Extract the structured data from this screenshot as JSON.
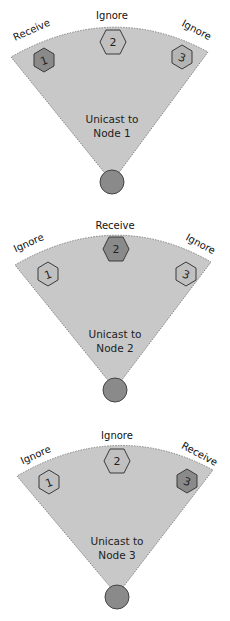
{
  "colors": {
    "wedge_fill": "#c8c8c8",
    "receiver_node": "#8a8a8a",
    "ignoring_node": "#c0c0c0",
    "source_node": "#8a8a8a"
  },
  "panels": [
    {
      "title_line1": "Unicast to",
      "title_line2": "Node 1",
      "nodes": [
        {
          "id": "1",
          "label": "Receive",
          "role": "receive"
        },
        {
          "id": "2",
          "label": "Ignore",
          "role": "ignore"
        },
        {
          "id": "3",
          "label": "Ignore",
          "role": "ignore"
        }
      ]
    },
    {
      "title_line1": "Unicast to",
      "title_line2": "Node 2",
      "nodes": [
        {
          "id": "1",
          "label": "Ignore",
          "role": "ignore"
        },
        {
          "id": "2",
          "label": "Receive",
          "role": "receive"
        },
        {
          "id": "3",
          "label": "Ignore",
          "role": "ignore"
        }
      ]
    },
    {
      "title_line1": "Unicast to",
      "title_line2": "Node 3",
      "nodes": [
        {
          "id": "1",
          "label": "Ignore",
          "role": "ignore"
        },
        {
          "id": "2",
          "label": "Ignore",
          "role": "ignore"
        },
        {
          "id": "3",
          "label": "Receive",
          "role": "receive"
        }
      ]
    }
  ]
}
